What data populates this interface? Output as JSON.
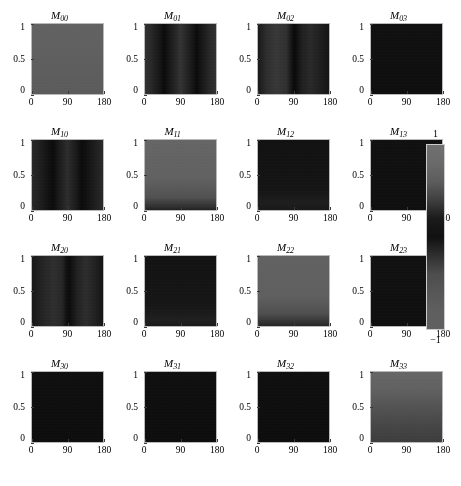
{
  "figure": {
    "kind": "mueller-matrix-heatmap-grid",
    "rows": 4,
    "cols": 4
  },
  "axes": {
    "x_ticks": [
      "0",
      "90",
      "180"
    ],
    "x_tick_values": [
      0,
      90,
      180
    ],
    "y_ticks": [
      "1",
      "0.5",
      "0"
    ],
    "y_tick_values": [
      1,
      0.5,
      0
    ],
    "xlim": [
      0,
      180
    ],
    "ylim": [
      0,
      1
    ]
  },
  "colorbar": {
    "name": "grayscale-colorbar",
    "max_label": "1",
    "min_label": "−1",
    "max_value": 1,
    "min_value": -1,
    "orientation": "vertical",
    "stops": [
      "#6e6e6e",
      "#686868",
      "#5a5a5a",
      "#3c3c3c",
      "#171717",
      "#0d0d0d",
      "#2c2c2c",
      "#4a4a4a",
      "#545454",
      "#5c5c5c",
      "#5e5e5e"
    ]
  },
  "chart_data": {
    "type": "heatmap",
    "title": "",
    "xlabel": "",
    "ylabel": "",
    "xlim": [
      0,
      180
    ],
    "ylim": [
      0,
      1
    ],
    "colormap": "grayscale",
    "clim": [
      -1,
      1
    ],
    "grid": false,
    "legend": "colorbar-right",
    "panels": [
      {
        "id": "M00",
        "label_base": "M",
        "label_sub": "00",
        "row": 0,
        "col": 0,
        "description": "uniform mid-gray field, value near 0",
        "mean_value": 0.0,
        "pattern": "uniform",
        "css_background": "linear-gradient(180deg,#5f5f5f 0%,#5c5c5c 45%,#585858 100%)"
      },
      {
        "id": "M01",
        "label_base": "M",
        "label_sub": "01",
        "row": 0,
        "col": 1,
        "description": "two dark vertical bands near 45 and 135 degrees on dark background",
        "mean_value": -0.55,
        "pattern": "vertical-bands",
        "css_background": "linear-gradient(90deg,#2d2d2d 0%,#262626 8%,#101010 22%,#060606 27%,#131313 34%,#303030 50%,#141414 66%,#060606 73%,#101010 78%,#262626 92%,#2e2e2e 100%)"
      },
      {
        "id": "M02",
        "label_base": "M",
        "label_sub": "02",
        "row": 0,
        "col": 2,
        "description": "dark field with lighter lobe left of center and sharp dark line at 90",
        "mean_value": -0.5,
        "pattern": "vertical-bands",
        "css_background": "linear-gradient(90deg,#151515 0%,#2a2a2a 12%,#343434 26%,#2c2c2c 40%,#0a0a0a 49%,#050505 52%,#1c1c1c 62%,#262626 74%,#1a1a1a 88%,#101010 100%)"
      },
      {
        "id": "M03",
        "label_base": "M",
        "label_sub": "03",
        "row": 0,
        "col": 3,
        "description": "near-black uniform field",
        "mean_value": -0.95,
        "pattern": "uniform",
        "css_background": "linear-gradient(180deg,#0c0c0c 0%,#0a0a0a 100%)"
      },
      {
        "id": "M10",
        "label_base": "M",
        "label_sub": "10",
        "row": 1,
        "col": 0,
        "description": "dark field with two darker vertical bands near 45 and 135",
        "mean_value": -0.6,
        "pattern": "vertical-bands",
        "css_background": "linear-gradient(90deg,#242424 0%,#1c1c1c 10%,#0c0c0c 24%,#070707 30%,#161616 38%,#2a2a2a 50%,#161616 62%,#070707 70%,#0c0c0c 76%,#1e1e1e 92%,#262626 100%)"
      },
      {
        "id": "M11",
        "label_base": "M",
        "label_sub": "11",
        "row": 1,
        "col": 1,
        "description": "mid-gray field with dark patches along the bottom edge near 45 and 135",
        "mean_value": 0.05,
        "pattern": "gray-with-dark-bottom",
        "css_background": "linear-gradient(180deg,#636363 0%,#5e5e5e 55%,#4e4e4e 82%,#2a2a2a 96%,#1d1d1d 100%)"
      },
      {
        "id": "M12",
        "label_base": "M",
        "label_sub": "12",
        "row": 1,
        "col": 2,
        "description": "near-black field with faint lighter ripples along bottom edge",
        "mean_value": -0.9,
        "pattern": "dark-with-bottom-ripple",
        "css_background": "linear-gradient(180deg,#0d0d0d 0%,#101010 70%,#1a1a1a 90%,#141414 100%)"
      },
      {
        "id": "M13",
        "label_base": "M",
        "label_sub": "13",
        "row": 1,
        "col": 3,
        "description": "near-black uniform field",
        "mean_value": -0.95,
        "pattern": "uniform",
        "css_background": "linear-gradient(180deg,#0c0c0c 0%,#0b0b0b 100%)"
      },
      {
        "id": "M20",
        "label_base": "M",
        "label_sub": "20",
        "row": 2,
        "col": 0,
        "description": "dark field with lighter vertical lobes and a dark line at 90",
        "mean_value": -0.6,
        "pattern": "vertical-bands",
        "css_background": "linear-gradient(90deg,#121212 0%,#202020 14%,#2b2b2b 30%,#242424 42%,#0b0b0b 49%,#080808 53%,#1e1e1e 64%,#2a2a2a 76%,#1c1c1c 90%,#101010 100%)"
      },
      {
        "id": "M21",
        "label_base": "M",
        "label_sub": "21",
        "row": 2,
        "col": 1,
        "description": "near-black field with faint lighter texture near bottom",
        "mean_value": -0.88,
        "pattern": "dark-with-bottom-ripple",
        "css_background": "linear-gradient(180deg,#0e0e0e 0%,#121212 72%,#1c1c1c 92%,#151515 100%)"
      },
      {
        "id": "M22",
        "label_base": "M",
        "label_sub": "22",
        "row": 2,
        "col": 2,
        "description": "mid-gray field with dark region at bottom center near 90",
        "mean_value": 0.02,
        "pattern": "gray-with-dark-bottom",
        "css_background": "linear-gradient(180deg,#5f5f5f 0%,#5c5c5c 58%,#4c4c4c 82%,#2e2e2e 95%,#222222 100%)"
      },
      {
        "id": "M23",
        "label_base": "M",
        "label_sub": "23",
        "row": 2,
        "col": 3,
        "description": "near-black uniform field",
        "mean_value": -0.94,
        "pattern": "uniform",
        "css_background": "linear-gradient(180deg,#0d0d0d 0%,#0b0b0b 100%)"
      },
      {
        "id": "M30",
        "label_base": "M",
        "label_sub": "30",
        "row": 3,
        "col": 0,
        "description": "near-black uniform field",
        "mean_value": -0.96,
        "pattern": "uniform",
        "css_background": "linear-gradient(180deg,#0b0b0b 0%,#090909 100%)"
      },
      {
        "id": "M31",
        "label_base": "M",
        "label_sub": "31",
        "row": 3,
        "col": 1,
        "description": "near-black uniform field",
        "mean_value": -0.96,
        "pattern": "uniform",
        "css_background": "linear-gradient(180deg,#0b0b0b 0%,#090909 100%)"
      },
      {
        "id": "M32",
        "label_base": "M",
        "label_sub": "32",
        "row": 3,
        "col": 2,
        "description": "near-black uniform field",
        "mean_value": -0.96,
        "pattern": "uniform",
        "css_background": "linear-gradient(180deg,#0b0b0b 0%,#090909 100%)"
      },
      {
        "id": "M33",
        "label_base": "M",
        "label_sub": "33",
        "row": 3,
        "col": 3,
        "description": "horizontal gradient, lighter gray at top fading darker toward bottom",
        "mean_value": -0.1,
        "pattern": "horizontal-gradient",
        "css_background": "linear-gradient(180deg,#636363 0%,#5f5f5f 22%,#525252 46%,#464646 70%,#3e3e3e 88%,#3a3a3a 100%)"
      }
    ]
  }
}
